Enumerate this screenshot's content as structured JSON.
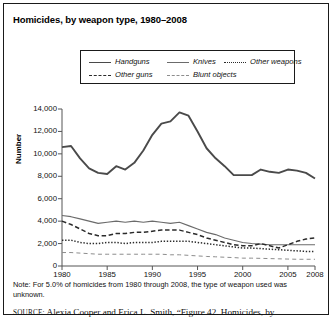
{
  "figure": {
    "title": "Homicides, by weapon type, 1980–2008",
    "note": "Note: For 5.0% of homicides from 1980 through 2008, the type of weapon used was unknown.",
    "source_prefix": "source:",
    "source_text": "Alexia Cooper and Erica L. Smith, “Figure 42. Homicides, by"
  },
  "legend": {
    "position": "top-center",
    "entries": [
      {
        "label": "Handguns",
        "style": "solid-thick",
        "color": "#4a4a4a"
      },
      {
        "label": "Knives",
        "style": "solid-thin",
        "color": "#6b6b6b"
      },
      {
        "label": "Other weapons",
        "style": "dotted",
        "color": "#2b2b2b"
      },
      {
        "label": "Other guns",
        "style": "dashed",
        "color": "#2b2b2b"
      },
      {
        "label": "Blunt objects",
        "style": "dashed-fine",
        "color": "#8d8d8d"
      }
    ]
  },
  "axes": {
    "ylabel": "Number",
    "yticks": [
      "14,000",
      "12,000",
      "10,000",
      "8,000",
      "6,000",
      "4,000",
      "2,000",
      "0"
    ],
    "xticks": [
      "1980",
      "1985",
      "1990",
      "1995",
      "2000",
      "2005",
      "2008"
    ]
  },
  "chart_data": {
    "type": "line",
    "title": "Homicides, by weapon type, 1980–2008",
    "xlabel": "",
    "ylabel": "Number",
    "xlim": [
      1980,
      2008
    ],
    "ylim": [
      0,
      14000
    ],
    "ytick_step": 2000,
    "grid": false,
    "legend_position": "top-center",
    "x": [
      1980,
      1981,
      1982,
      1983,
      1984,
      1985,
      1986,
      1987,
      1988,
      1989,
      1990,
      1991,
      1992,
      1993,
      1994,
      1995,
      1996,
      1997,
      1998,
      1999,
      2000,
      2001,
      2002,
      2003,
      2004,
      2005,
      2006,
      2007,
      2008
    ],
    "series": [
      {
        "name": "Handguns",
        "style": "solid-thick",
        "color": "#4a4a4a",
        "values": [
          10600,
          10700,
          9600,
          8700,
          8300,
          8200,
          8900,
          8600,
          9200,
          10300,
          11700,
          12700,
          12900,
          13700,
          13400,
          12000,
          10500,
          9600,
          8900,
          8100,
          8100,
          8100,
          8600,
          8400,
          8300,
          8600,
          8500,
          8300,
          7800
        ]
      },
      {
        "name": "Knives",
        "style": "solid-thin",
        "color": "#6b6b6b",
        "values": [
          4500,
          4400,
          4200,
          4000,
          3800,
          3900,
          4000,
          3900,
          4000,
          3900,
          4000,
          3900,
          3800,
          3900,
          3600,
          3300,
          3000,
          2800,
          2500,
          2300,
          2100,
          2000,
          1950,
          1900,
          1900,
          1900,
          1900,
          1900,
          1900
        ]
      },
      {
        "name": "Other guns",
        "style": "dashed",
        "color": "#2b2b2b",
        "values": [
          4000,
          3700,
          3300,
          2900,
          2700,
          2700,
          2900,
          2900,
          3000,
          3000,
          3100,
          3200,
          3200,
          3200,
          3000,
          2800,
          2500,
          2300,
          2100,
          1900,
          1800,
          1800,
          2000,
          1800,
          1600,
          1900,
          2200,
          2400,
          2500
        ]
      },
      {
        "name": "Other weapons",
        "style": "dotted",
        "color": "#2b2b2b",
        "values": [
          2300,
          2300,
          2100,
          2000,
          2000,
          2100,
          2100,
          2000,
          2100,
          2100,
          2100,
          2200,
          2200,
          2200,
          2200,
          2100,
          2000,
          1900,
          1800,
          1700,
          1600,
          1600,
          1550,
          1500,
          1450,
          1400,
          1350,
          1300,
          1300
        ]
      },
      {
        "name": "Blunt objects",
        "style": "dashed-fine",
        "color": "#8d8d8d",
        "values": [
          1200,
          1200,
          1150,
          1100,
          1050,
          1050,
          1050,
          1050,
          1050,
          1050,
          1050,
          1050,
          1000,
          1000,
          950,
          900,
          850,
          820,
          780,
          750,
          700,
          700,
          680,
          660,
          640,
          620,
          600,
          600,
          600
        ]
      }
    ]
  }
}
